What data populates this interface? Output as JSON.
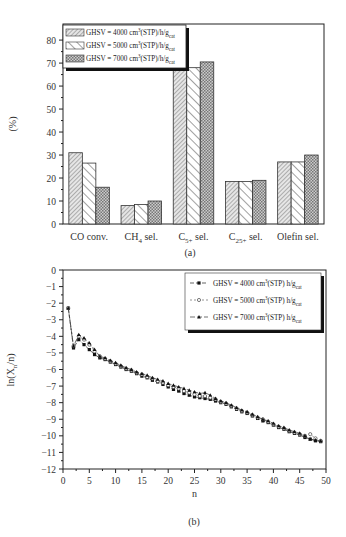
{
  "chart_data": [
    {
      "panel": "(a)",
      "type": "bar",
      "title": "",
      "xlabel": "",
      "ylabel": "(%)",
      "ylim": [
        0,
        87
      ],
      "yticks": [
        0,
        10,
        20,
        30,
        40,
        50,
        60,
        70,
        80
      ],
      "categories": [
        "CO conv.",
        "CH4 sel.",
        "C5+ sel.",
        "C25+ sel.",
        "Olefin sel."
      ],
      "category_labels": [
        {
          "main": "CO conv.",
          "sub": "",
          "suffix": ""
        },
        {
          "main": "CH",
          "sub": "4",
          "suffix": " sel."
        },
        {
          "main": "C",
          "sub": "5+",
          "suffix": " sel."
        },
        {
          "main": "C",
          "sub": "25+",
          "suffix": " sel."
        },
        {
          "main": "Olefin sel.",
          "sub": "",
          "suffix": ""
        }
      ],
      "series": [
        {
          "name": "GHSV = 4000 cm3(STP)/h/gcat",
          "pattern": "fine-diagonal",
          "values": [
            31,
            8,
            69,
            18.5,
            27
          ]
        },
        {
          "name": "GHSV = 5000 cm3(STP)/h/gcat",
          "pattern": "wide-diagonal",
          "values": [
            26.5,
            8.5,
            68,
            18.5,
            27
          ]
        },
        {
          "name": "GHSV = 7000 cm3(STP)/h/gcat",
          "pattern": "crosshatch",
          "values": [
            16,
            10,
            70.5,
            19,
            30
          ]
        }
      ],
      "legend": {
        "position": "upper-left",
        "entries": [
          {
            "prefix": "GHSV = 4000 cm",
            "sup": "3",
            "mid": "(STP)/h/g",
            "sub": "cat"
          },
          {
            "prefix": "GHSV = 5000 cm",
            "sup": "3",
            "mid": "(STP)/h/g",
            "sub": "cat"
          },
          {
            "prefix": "GHSV = 7000 cm",
            "sup": "3",
            "mid": "(STP)/h/g",
            "sub": "cat"
          }
        ]
      },
      "caption": "(a)",
      "grid": false
    },
    {
      "panel": "(b)",
      "type": "line",
      "xlabel": "n",
      "ylabel": "ln(Xn/n)",
      "ylabel_parts": {
        "pre": "ln(X",
        "sub": "n",
        "post": "/n)"
      },
      "xlim": [
        0,
        50
      ],
      "ylim": [
        -12,
        0
      ],
      "xticks": [
        0,
        5,
        10,
        15,
        20,
        25,
        30,
        35,
        40,
        45,
        50
      ],
      "yticks": [
        0,
        -1,
        -2,
        -3,
        -4,
        -5,
        -6,
        -7,
        -8,
        -9,
        -10,
        -11,
        -12
      ],
      "x": [
        1,
        2,
        3,
        4,
        5,
        6,
        7,
        8,
        9,
        10,
        11,
        12,
        13,
        14,
        15,
        16,
        17,
        18,
        19,
        20,
        21,
        22,
        23,
        24,
        25,
        26,
        27,
        28,
        29,
        30,
        31,
        32,
        33,
        34,
        35,
        36,
        37,
        38,
        39,
        40,
        41,
        42,
        43,
        44,
        45,
        46,
        47,
        48,
        49
      ],
      "series": [
        {
          "name": "GHSV = 4000 cm3(STP) h/gcat",
          "marker": "filled-square",
          "values": [
            -2.3,
            -4.7,
            -4.2,
            -4.5,
            -4.8,
            -5.1,
            -5.3,
            -5.4,
            -5.55,
            -5.7,
            -5.85,
            -6.0,
            -6.1,
            -6.25,
            -6.4,
            -6.5,
            -6.65,
            -6.75,
            -6.9,
            -7.05,
            -7.2,
            -7.3,
            -7.45,
            -7.55,
            -7.65,
            -7.7,
            -7.75,
            -7.8,
            -7.9,
            -8.0,
            -8.1,
            -8.25,
            -8.4,
            -8.55,
            -8.65,
            -8.8,
            -8.95,
            -9.1,
            -9.2,
            -9.35,
            -9.5,
            -9.6,
            -9.75,
            -9.85,
            -9.95,
            -10.1,
            -10.2,
            -10.3,
            -10.35
          ]
        },
        {
          "name": "GHSV = 5000 cm3(STP) h/gcat",
          "marker": "open-circle",
          "values": [
            -2.3,
            -4.6,
            -4.0,
            -4.2,
            -4.5,
            -4.9,
            -5.2,
            -5.35,
            -5.5,
            -5.65,
            -5.8,
            -5.95,
            -6.05,
            -6.2,
            -6.3,
            -6.45,
            -6.55,
            -6.7,
            -6.8,
            -6.95,
            -7.05,
            -7.15,
            -7.3,
            -7.4,
            -7.5,
            -7.6,
            -7.6,
            -7.7,
            -7.8,
            -7.95,
            -8.05,
            -8.2,
            -8.35,
            -8.5,
            -8.6,
            -8.75,
            -8.9,
            -9.0,
            -9.15,
            -9.3,
            -9.45,
            -9.55,
            -9.7,
            -9.8,
            -9.9,
            -10.0,
            -9.9,
            -10.15,
            -10.3
          ]
        },
        {
          "name": "GHSV = 7000 cm3(STP) h/gcat",
          "marker": "filled-triangle",
          "values": [
            -2.3,
            -4.6,
            -3.9,
            -4.1,
            -4.4,
            -4.8,
            -5.2,
            -5.3,
            -5.45,
            -5.6,
            -5.75,
            -5.9,
            -6.0,
            -6.15,
            -6.25,
            -6.35,
            -6.5,
            -6.6,
            -6.7,
            -6.85,
            -6.95,
            -7.05,
            -7.15,
            -7.25,
            -7.35,
            -7.45,
            -7.4,
            -7.55,
            -7.75,
            -7.9,
            -8.0,
            -8.15,
            -8.3,
            -8.45,
            -8.55,
            -8.7,
            -8.85,
            -9.0,
            -9.1,
            -9.25,
            -9.4,
            -9.5,
            -9.65,
            -9.75,
            -9.85,
            -10.0,
            -10.2,
            -10.25,
            -10.3
          ]
        }
      ],
      "legend": {
        "position": "upper-right",
        "entries": [
          {
            "prefix": "GHSV = 4000 cm",
            "sup": "3",
            "mid": "(STP) h/g",
            "sub": "cat"
          },
          {
            "prefix": "GHSV = 5000 cm",
            "sup": "3",
            "mid": "(STP) h/g",
            "sub": "cat"
          },
          {
            "prefix": "GHSV = 7000 cm",
            "sup": "3",
            "mid": "(STP) h/g",
            "sub": "cat"
          }
        ]
      },
      "caption": "(b)",
      "grid": false
    }
  ]
}
